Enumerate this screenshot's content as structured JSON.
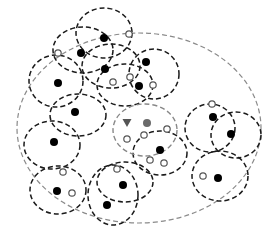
{
  "diagram": {
    "type": "clustering-illustration",
    "colors": {
      "outer_boundary": "#8a8a8a",
      "cluster_boundary": "#1a1a1a",
      "center_boundary": "#888888",
      "filled_point": "#000000",
      "highlight_point": "#6a6a6a",
      "open_point_stroke": "#555555",
      "triangle": "#555555"
    },
    "outer_ellipse": {
      "cx": 139,
      "cy": 128,
      "rx": 122,
      "ry": 95
    },
    "center_ellipse": {
      "cx": 145,
      "cy": 130,
      "rx": 32,
      "ry": 26
    },
    "clusters": [
      {
        "cx": 104,
        "cy": 33,
        "rx": 28,
        "ry": 25
      },
      {
        "cx": 83,
        "cy": 50,
        "rx": 30,
        "ry": 23
      },
      {
        "cx": 111,
        "cy": 66,
        "rx": 29,
        "ry": 22
      },
      {
        "cx": 56,
        "cy": 81,
        "rx": 27,
        "ry": 26
      },
      {
        "cx": 154,
        "cy": 74,
        "rx": 25,
        "ry": 25
      },
      {
        "cx": 125,
        "cy": 85,
        "rx": 28,
        "ry": 21
      },
      {
        "cx": 78,
        "cy": 115,
        "rx": 28,
        "ry": 21
      },
      {
        "cx": 52,
        "cy": 145,
        "rx": 28,
        "ry": 24
      },
      {
        "cx": 160,
        "cy": 153,
        "rx": 27,
        "ry": 22
      },
      {
        "cx": 210,
        "cy": 128,
        "rx": 25,
        "ry": 24
      },
      {
        "cx": 236,
        "cy": 135,
        "rx": 25,
        "ry": 23
      },
      {
        "cx": 220,
        "cy": 176,
        "rx": 28,
        "ry": 25
      },
      {
        "cx": 58,
        "cy": 190,
        "rx": 28,
        "ry": 24
      },
      {
        "cx": 113,
        "cy": 195,
        "rx": 25,
        "ry": 30
      },
      {
        "cx": 125,
        "cy": 182,
        "rx": 28,
        "ry": 20
      }
    ],
    "filled_points": [
      {
        "x": 104,
        "y": 38
      },
      {
        "x": 81,
        "y": 53
      },
      {
        "x": 105,
        "y": 69
      },
      {
        "x": 58,
        "y": 83
      },
      {
        "x": 75,
        "y": 112
      },
      {
        "x": 54,
        "y": 142
      },
      {
        "x": 146,
        "y": 62
      },
      {
        "x": 139,
        "y": 86
      },
      {
        "x": 160,
        "y": 150
      },
      {
        "x": 213,
        "y": 117
      },
      {
        "x": 231,
        "y": 134
      },
      {
        "x": 218,
        "y": 178
      },
      {
        "x": 57,
        "y": 191
      },
      {
        "x": 107,
        "y": 205
      },
      {
        "x": 123,
        "y": 185
      }
    ],
    "highlight_points": [
      {
        "x": 147,
        "y": 123
      }
    ],
    "open_points": [
      {
        "x": 58,
        "y": 53
      },
      {
        "x": 129,
        "y": 34
      },
      {
        "x": 113,
        "y": 82
      },
      {
        "x": 130,
        "y": 77
      },
      {
        "x": 153,
        "y": 85
      },
      {
        "x": 127,
        "y": 139
      },
      {
        "x": 144,
        "y": 135
      },
      {
        "x": 167,
        "y": 129
      },
      {
        "x": 150,
        "y": 160
      },
      {
        "x": 164,
        "y": 163
      },
      {
        "x": 203,
        "y": 176
      },
      {
        "x": 63,
        "y": 172
      },
      {
        "x": 72,
        "y": 193
      },
      {
        "x": 117,
        "y": 169
      },
      {
        "x": 212,
        "y": 104
      }
    ],
    "triangles": [
      {
        "x": 127,
        "y": 123
      }
    ]
  }
}
